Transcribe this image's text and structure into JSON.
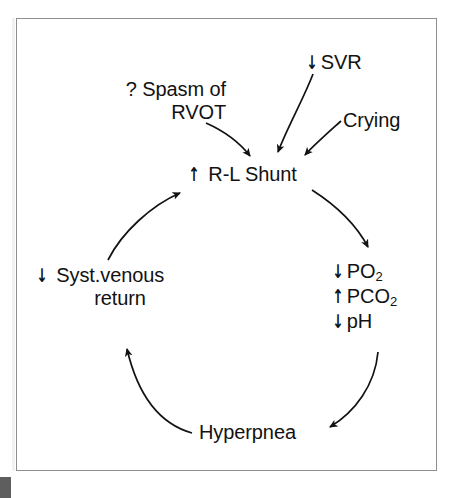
{
  "figure": {
    "type": "cycle-diagram",
    "title_visible": false,
    "background_color": "#ffffff",
    "frame_color": "#8e8e8e",
    "text_color": "#121212",
    "arrow_color": "#121212"
  },
  "nodes": {
    "spasm": {
      "line1": "? Spasm of",
      "line2": "RVOT",
      "change": "none"
    },
    "svr": {
      "arrow": "↓",
      "label": "SVR",
      "change": "decrease"
    },
    "crying": {
      "label": "Crying",
      "change": "none"
    },
    "shunt": {
      "arrow": "↑",
      "label": "R-L Shunt",
      "change": "increase"
    },
    "gases": {
      "po2": {
        "arrow": "↓",
        "label": "PO",
        "subscript": "2",
        "change": "decrease"
      },
      "pco2": {
        "arrow": "↑",
        "label": "PCO",
        "subscript": "2",
        "change": "increase"
      },
      "ph": {
        "arrow": "↓",
        "label": "pH",
        "subscript": "",
        "change": "decrease"
      }
    },
    "venous": {
      "arrow": "↓",
      "line1": "Syst.venous",
      "line2": "return",
      "change": "decrease"
    },
    "hyperpnea": {
      "label": "Hyperpnea",
      "change": "none"
    }
  },
  "edges": [
    {
      "name": "spasm-to-shunt",
      "from": "spasm",
      "to": "shunt",
      "style": "curved-arrow"
    },
    {
      "name": "svr-to-shunt",
      "from": "svr",
      "to": "shunt",
      "style": "curved-arrow"
    },
    {
      "name": "crying-to-shunt",
      "from": "crying",
      "to": "shunt",
      "style": "curved-arrow"
    },
    {
      "name": "shunt-to-gases",
      "from": "shunt",
      "to": "gases",
      "style": "curved-arrow"
    },
    {
      "name": "gases-to-hyperpnea",
      "from": "gases",
      "to": "hyperpnea",
      "style": "curved-arrow"
    },
    {
      "name": "hyperpnea-to-venous",
      "from": "hyperpnea",
      "to": "venous",
      "style": "curved-arrow"
    },
    {
      "name": "venous-to-shunt",
      "from": "venous",
      "to": "shunt",
      "style": "curved-arrow"
    }
  ]
}
